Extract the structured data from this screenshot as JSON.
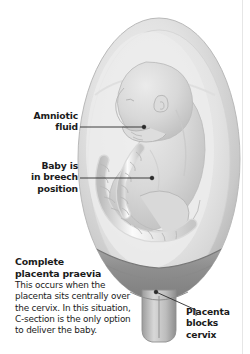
{
  "figure": {
    "background_color": "#ffffff",
    "text_color": "#1b1b1b",
    "leader_color": "#2b2b2b"
  },
  "labels": {
    "amniotic": "Amniotic\nfluid",
    "breech": "Baby is\nin breech\nposition",
    "placenta_cervix": "Placenta\nblocks\ncervix"
  },
  "caption": {
    "title": "Complete\nplacenta praevia",
    "body": "This occurs when the placenta sits centrally over the cervix. In this situation, C-section is the only option to deliver the baby."
  },
  "anatomy": {
    "uterus": "uterus-wall",
    "amniotic_fluid": "amniotic-fluid",
    "fetus": "fetus-breech",
    "umbilical_cord": "umbilical-cord",
    "placenta": "placenta",
    "cervix": "cervix"
  },
  "colors": {
    "uterus_rim": "#cfcfcf",
    "uterus_fill": "#dcdcdc",
    "fluid": "#e9e9e9",
    "fetus": "#d2d2d2",
    "cord": "#f2f2f2",
    "placenta": "#9a9a9a",
    "cervix": "#b4b4b4",
    "edge_rule": "#e6e6e6"
  }
}
